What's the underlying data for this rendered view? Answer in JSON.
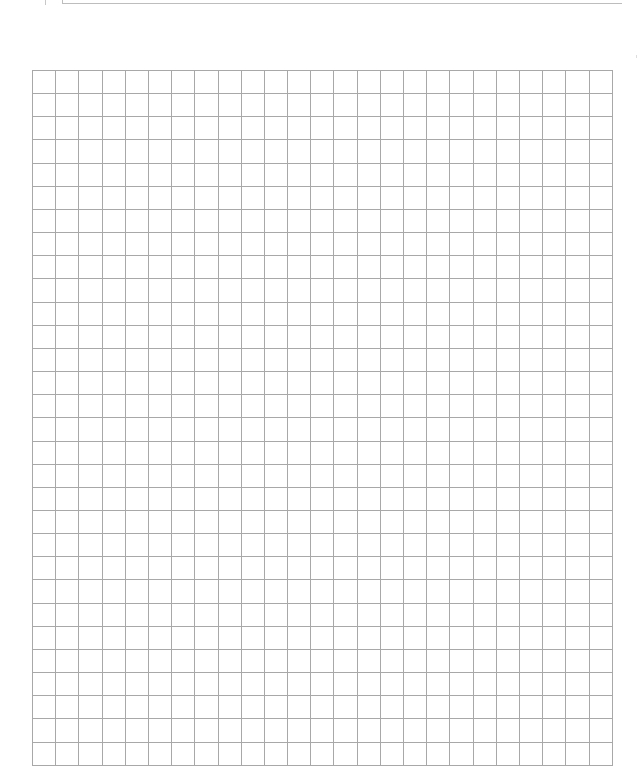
{
  "document": {
    "type": "graph-paper",
    "grid": {
      "columns": 25,
      "rows": 30,
      "cell_width_px": 23.2,
      "cell_height_px": 23.17,
      "line_color": "#a8a8a8",
      "background_color": "#ffffff"
    },
    "header_field": {
      "label": "",
      "value": ""
    }
  }
}
